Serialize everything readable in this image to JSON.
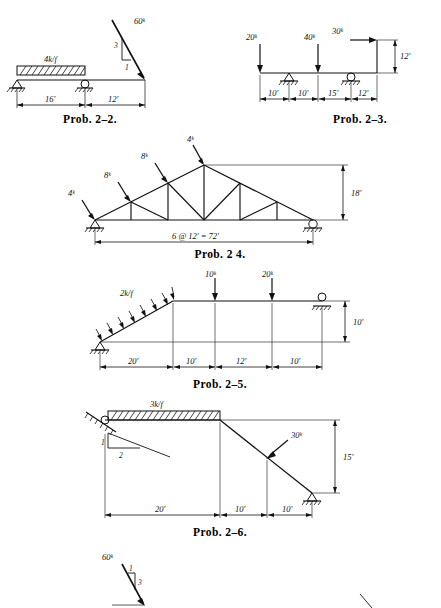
{
  "page": {
    "background": "#ffffff",
    "ink": "#111111",
    "kind": "textbook-problem-figures"
  },
  "figures": [
    {
      "id": "prob-2-2",
      "caption": "Prob. 2–2.",
      "type": "simply-supported-beam-with-overhang",
      "labels": {
        "distributed_load": "4k/f",
        "point_load": "60ᵏ",
        "slope_rise": "3",
        "slope_run": "1",
        "dim_left": "16'",
        "dim_right": "12'"
      },
      "supports": [
        "pin",
        "roller"
      ],
      "dimensions": [
        16,
        12
      ],
      "loads": [
        {
          "kind": "udl",
          "magnitude": "4 k/f",
          "span_ft": 16
        },
        {
          "kind": "inclined-point",
          "magnitude": "60 k",
          "slope": "3:1",
          "at_ft": 28
        }
      ]
    },
    {
      "id": "prob-2-3",
      "caption": "Prob. 2–3.",
      "type": "beam-with-vertical-leg",
      "labels": {
        "load_1": "20ᵏ",
        "load_2": "40ᵏ",
        "load_3": "30ᵏ",
        "dim_height": "12'",
        "dim_a": "10'",
        "dim_b": "10'",
        "dim_c": "15'",
        "dim_d": "12'"
      },
      "supports": [
        "pin",
        "roller"
      ],
      "dimensions": [
        10,
        10,
        15,
        12
      ],
      "loads": [
        {
          "kind": "point-down",
          "magnitude": "20 k",
          "at_ft": 0
        },
        {
          "kind": "point-down",
          "magnitude": "40 k",
          "at_ft": 20
        },
        {
          "kind": "point-horizontal",
          "magnitude": "30 k",
          "at_ft": 47
        }
      ]
    },
    {
      "id": "prob-2-4",
      "caption": "Prob. 2 4.",
      "type": "roof-truss",
      "labels": {
        "load_1": "4ᵏ",
        "load_2": "8ᵏ",
        "load_3": "8ᵏ",
        "load_4": "4ᵏ",
        "dim_height": "18'",
        "dim_span": "6 @ 12' = 72'"
      },
      "supports": [
        "pin",
        "roller"
      ],
      "panels": 6,
      "panel_ft": 12,
      "span_ft": 72,
      "height_ft": 18,
      "loads": [
        {
          "magnitude": "4 k",
          "joint": "L0"
        },
        {
          "magnitude": "8 k",
          "joint": "U1"
        },
        {
          "magnitude": "8 k",
          "joint": "U2"
        },
        {
          "magnitude": "4 k",
          "joint": "U3"
        }
      ]
    },
    {
      "id": "prob-2-5",
      "caption": "Prob. 2–5.",
      "type": "inclined-member-frame",
      "labels": {
        "distributed_load": "2k/f",
        "load_1": "10ᵏ",
        "load_2": "20ᵏ",
        "dim_height": "10'",
        "dim_a": "20'",
        "dim_b": "10'",
        "dim_c": "12'",
        "dim_d": "10'"
      },
      "supports": [
        "pin",
        "roller"
      ],
      "dimensions": [
        20,
        10,
        12,
        10
      ],
      "loads": [
        {
          "kind": "udl-normal",
          "magnitude": "2 k/f",
          "on": "inclined member"
        },
        {
          "kind": "point-down",
          "magnitude": "10 k"
        },
        {
          "kind": "point-down",
          "magnitude": "20 k"
        }
      ]
    },
    {
      "id": "prob-2-6",
      "caption": "Prob. 2–6.",
      "type": "frame-with-inclined-roller",
      "labels": {
        "distributed_load": "3k/f",
        "slope_rise": "1",
        "slope_run": "2",
        "point_load": "30ᵏ",
        "dim_height": "15'",
        "dim_a": "20'",
        "dim_b": "10'",
        "dim_c": "10'"
      },
      "supports": [
        "inclined-roller",
        "pin"
      ],
      "dimensions": [
        20,
        10,
        10
      ],
      "loads": [
        {
          "kind": "udl",
          "magnitude": "3 k/f",
          "span_ft": 20
        },
        {
          "kind": "inclined-point",
          "magnitude": "30 k"
        }
      ]
    },
    {
      "id": "prob-2-7-partial",
      "caption": "",
      "type": "partial-figure-next-problem",
      "labels": {
        "point_load": "60ᵏ",
        "slope_rise": "1",
        "slope_run": "3"
      }
    }
  ]
}
